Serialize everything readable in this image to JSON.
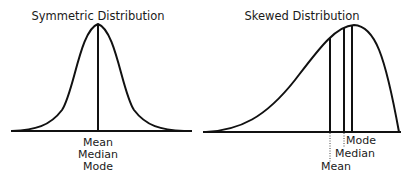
{
  "panels": [
    {
      "id": "symmetric",
      "title": "Symmetric Distribution",
      "labels": [
        "Mean",
        "Median",
        "Mode"
      ]
    },
    {
      "id": "skewed",
      "title": "Skewed Distribution",
      "labels": {
        "mode": "Mode",
        "median": "Median",
        "mean": "Mean"
      }
    }
  ],
  "colors": {
    "ink": "#111111",
    "background": "#ffffff"
  }
}
